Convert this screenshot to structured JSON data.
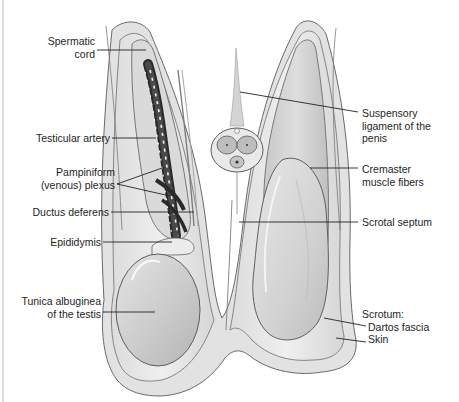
{
  "figure": {
    "colors": {
      "background": "#ffffff",
      "tissue_light": "#e8e8e8",
      "tissue_mid": "#cfcfcf",
      "tissue_dark": "#9a9a9a",
      "plexus": "#2a2a2a",
      "outline": "#5a5a5a",
      "leader_line": "#222222",
      "label_text": "#1e1e1e"
    }
  },
  "labels": {
    "left": [
      {
        "id": "spermatic-cord",
        "lines": [
          "Spermatic",
          "cord"
        ]
      },
      {
        "id": "testicular-artery",
        "lines": [
          "Testicular artery"
        ]
      },
      {
        "id": "pampiniform-plexus",
        "lines": [
          "Pampiniform",
          "(venous) plexus"
        ]
      },
      {
        "id": "ductus-deferens",
        "lines": [
          "Ductus deferens"
        ]
      },
      {
        "id": "epididymis",
        "lines": [
          "Epididymis"
        ]
      },
      {
        "id": "tunica-albuginea",
        "lines": [
          "Tunica albuginea",
          "of the testis"
        ]
      }
    ],
    "right": [
      {
        "id": "suspensory-ligament",
        "lines": [
          "Suspensory",
          "ligament of the",
          "penis"
        ]
      },
      {
        "id": "cremaster",
        "lines": [
          "Cremaster",
          "muscle fibers"
        ]
      },
      {
        "id": "scrotal-septum",
        "lines": [
          "Scrotal septum"
        ]
      },
      {
        "id": "scrotum",
        "lines": [
          "Scrotum:",
          "Dartos fascia",
          "Skin"
        ]
      }
    ]
  }
}
